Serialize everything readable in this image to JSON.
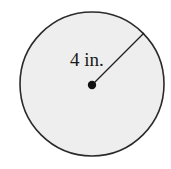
{
  "diagram": {
    "shape": "circle",
    "radius_label": "4 in.",
    "colors": {
      "fill": "#eeeeee",
      "stroke": "#2a2a2a",
      "center_dot": "#111111",
      "text": "#1a1a1a"
    }
  }
}
